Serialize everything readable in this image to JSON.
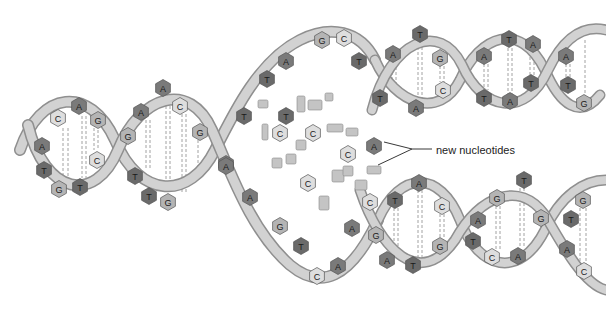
{
  "diagram": {
    "label": {
      "text": "new nucleotides",
      "x": 436,
      "y": 154,
      "pointer_start": [
        412,
        152
      ],
      "pointer_targets": [
        [
          384,
          142
        ],
        [
          378,
          165
        ]
      ]
    },
    "colors": {
      "background": "#ffffff",
      "backbone_fill": "#cfcfcf",
      "backbone_stroke": "#8e8e8e",
      "base_A": "#7a7a7a",
      "base_T": "#6a6a6a",
      "base_G": "#b4b4b4",
      "base_C": "#dedede",
      "base_stroke": "#555555",
      "hbond": "#888888",
      "label": "#222222"
    },
    "base_types": [
      "A",
      "T",
      "G",
      "C"
    ],
    "parent_helix_bases": [
      {
        "b": "C",
        "x": 58,
        "y": 118
      },
      {
        "b": "A",
        "x": 79,
        "y": 106
      },
      {
        "b": "G",
        "x": 98,
        "y": 120
      },
      {
        "b": "A",
        "x": 42,
        "y": 146
      },
      {
        "b": "C",
        "x": 97,
        "y": 160
      },
      {
        "b": "T",
        "x": 44,
        "y": 170
      },
      {
        "b": "G",
        "x": 59,
        "y": 189
      },
      {
        "b": "T",
        "x": 80,
        "y": 187
      },
      {
        "b": "A",
        "x": 163,
        "y": 88
      },
      {
        "b": "A",
        "x": 141,
        "y": 112
      },
      {
        "b": "C",
        "x": 180,
        "y": 106
      },
      {
        "b": "G",
        "x": 128,
        "y": 136
      },
      {
        "b": "G",
        "x": 200,
        "y": 132
      },
      {
        "b": "T",
        "x": 135,
        "y": 176
      },
      {
        "b": "T",
        "x": 149,
        "y": 196
      },
      {
        "b": "G",
        "x": 168,
        "y": 202
      },
      {
        "b": "A",
        "x": 226,
        "y": 164
      }
    ],
    "fork_top_strand_bases": [
      {
        "b": "G",
        "x": 322,
        "y": 40
      },
      {
        "b": "C",
        "x": 344,
        "y": 38
      },
      {
        "b": "A",
        "x": 286,
        "y": 61
      },
      {
        "b": "T",
        "x": 359,
        "y": 61
      },
      {
        "b": "T",
        "x": 267,
        "y": 79
      },
      {
        "b": "T",
        "x": 244,
        "y": 116
      },
      {
        "b": "T",
        "x": 286,
        "y": 116
      },
      {
        "b": "C",
        "x": 280,
        "y": 133
      },
      {
        "b": "C",
        "x": 313,
        "y": 133
      },
      {
        "b": "C",
        "x": 348,
        "y": 154
      },
      {
        "b": "A",
        "x": 374,
        "y": 146
      },
      {
        "b": "C",
        "x": 308,
        "y": 183
      }
    ],
    "fork_bottom_strand_bases": [
      {
        "b": "A",
        "x": 226,
        "y": 166
      },
      {
        "b": "A",
        "x": 250,
        "y": 197
      },
      {
        "b": "G",
        "x": 280,
        "y": 226
      },
      {
        "b": "T",
        "x": 301,
        "y": 246
      },
      {
        "b": "C",
        "x": 317,
        "y": 276
      },
      {
        "b": "A",
        "x": 338,
        "y": 266
      },
      {
        "b": "A",
        "x": 352,
        "y": 228
      },
      {
        "b": "G",
        "x": 376,
        "y": 235
      },
      {
        "b": "C",
        "x": 370,
        "y": 202
      }
    ],
    "upper_daughter_bases": [
      {
        "b": "T",
        "x": 420,
        "y": 34
      },
      {
        "b": "A",
        "x": 393,
        "y": 54
      },
      {
        "b": "G",
        "x": 440,
        "y": 58
      },
      {
        "b": "C",
        "x": 443,
        "y": 90
      },
      {
        "b": "T",
        "x": 380,
        "y": 98
      },
      {
        "b": "A",
        "x": 416,
        "y": 108
      },
      {
        "b": "A",
        "x": 484,
        "y": 56
      },
      {
        "b": "T",
        "x": 509,
        "y": 39
      },
      {
        "b": "A",
        "x": 533,
        "y": 44
      },
      {
        "b": "T",
        "x": 531,
        "y": 83
      },
      {
        "b": "T",
        "x": 484,
        "y": 98
      },
      {
        "b": "A",
        "x": 510,
        "y": 101
      },
      {
        "b": "A",
        "x": 566,
        "y": 56
      },
      {
        "b": "T",
        "x": 568,
        "y": 85
      },
      {
        "b": "G",
        "x": 584,
        "y": 103
      }
    ],
    "lower_daughter_bases": [
      {
        "b": "T",
        "x": 395,
        "y": 200
      },
      {
        "b": "A",
        "x": 419,
        "y": 183
      },
      {
        "b": "C",
        "x": 442,
        "y": 206
      },
      {
        "b": "G",
        "x": 440,
        "y": 246
      },
      {
        "b": "A",
        "x": 387,
        "y": 260
      },
      {
        "b": "T",
        "x": 413,
        "y": 265
      },
      {
        "b": "G",
        "x": 497,
        "y": 198
      },
      {
        "b": "T",
        "x": 524,
        "y": 180
      },
      {
        "b": "G",
        "x": 541,
        "y": 218
      },
      {
        "b": "A",
        "x": 478,
        "y": 220
      },
      {
        "b": "T",
        "x": 473,
        "y": 241
      },
      {
        "b": "C",
        "x": 492,
        "y": 257
      },
      {
        "b": "A",
        "x": 518,
        "y": 256
      },
      {
        "b": "G",
        "x": 583,
        "y": 200
      },
      {
        "b": "T",
        "x": 571,
        "y": 219
      },
      {
        "b": "A",
        "x": 567,
        "y": 249
      },
      {
        "b": "C",
        "x": 584,
        "y": 271
      }
    ],
    "free_fragments": [
      {
        "x": 258,
        "y": 100,
        "w": 10,
        "h": 8
      },
      {
        "x": 297,
        "y": 96,
        "w": 8,
        "h": 16
      },
      {
        "x": 308,
        "y": 100,
        "w": 14,
        "h": 10
      },
      {
        "x": 325,
        "y": 93,
        "w": 8,
        "h": 8
      },
      {
        "x": 262,
        "y": 124,
        "w": 6,
        "h": 16
      },
      {
        "x": 296,
        "y": 140,
        "w": 10,
        "h": 10
      },
      {
        "x": 327,
        "y": 124,
        "w": 16,
        "h": 8
      },
      {
        "x": 346,
        "y": 128,
        "w": 12,
        "h": 8
      },
      {
        "x": 332,
        "y": 170,
        "w": 12,
        "h": 12
      },
      {
        "x": 319,
        "y": 196,
        "w": 10,
        "h": 14
      },
      {
        "x": 343,
        "y": 166,
        "w": 10,
        "h": 10
      },
      {
        "x": 367,
        "y": 166,
        "w": 14,
        "h": 8
      },
      {
        "x": 272,
        "y": 158,
        "w": 10,
        "h": 10
      },
      {
        "x": 286,
        "y": 154,
        "w": 10,
        "h": 10
      },
      {
        "x": 355,
        "y": 180,
        "w": 12,
        "h": 10
      }
    ]
  }
}
